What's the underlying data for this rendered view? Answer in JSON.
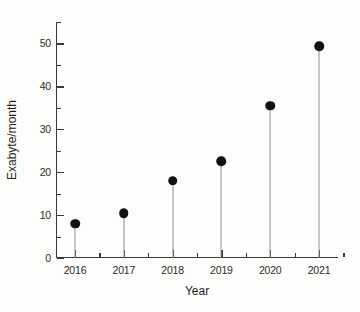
{
  "chart_data": {
    "type": "scatter",
    "plot_style": "stem-lollipop",
    "title": "",
    "xlabel": "Year",
    "ylabel": "Exabyte/month",
    "categories": [
      "2016",
      "2017",
      "2018",
      "2019",
      "2020",
      "2021"
    ],
    "values": [
      8.0,
      10.4,
      18.0,
      22.5,
      35.5,
      49.3
    ],
    "series": [
      {
        "name": "Exabyte/month",
        "values": [
          8.0,
          10.4,
          18.0,
          22.5,
          35.5,
          49.3
        ]
      }
    ],
    "ylim": [
      0,
      55
    ],
    "xlim": [
      2015.5,
      2021.6
    ],
    "y_major_ticks": [
      0,
      10,
      20,
      30,
      40,
      50
    ],
    "y_minor_ticks": [
      5,
      15,
      25,
      35,
      45,
      55
    ],
    "y_tick_labels": [
      "0",
      "10",
      "20",
      "30",
      "40",
      "50"
    ],
    "x_tick_labels": [
      "2016",
      "2017",
      "2018",
      "2019",
      "2020",
      "2021"
    ],
    "grid": false,
    "legend": null,
    "legend_position": "none",
    "marker_color": "#111111",
    "stem_color": "#8d8d8d",
    "axis_color": "#3a3a3a",
    "background_color": "#fdfdfc"
  }
}
